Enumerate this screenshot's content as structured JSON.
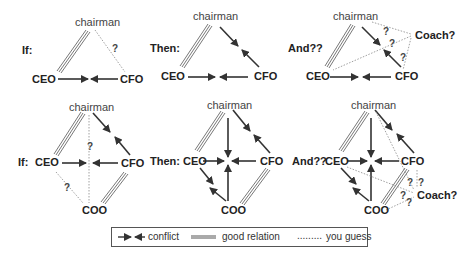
{
  "panels": [
    {
      "prefix": "If:",
      "nodes": {
        "chairman": "chairman",
        "ceo": "CEO",
        "cfo": "CFO"
      },
      "questions": [
        "?"
      ]
    },
    {
      "prefix": "Then:",
      "nodes": {
        "chairman": "chairman",
        "ceo": "CEO",
        "cfo": "CFO"
      }
    },
    {
      "prefix": "And??",
      "nodes": {
        "chairman": "chairman",
        "ceo": "CEO",
        "cfo": "CFO",
        "coach": "Coach?"
      },
      "questions": [
        "?",
        "?",
        "?"
      ]
    },
    {
      "prefix": "If:",
      "nodes": {
        "chairman": "chairman",
        "ceo": "CEO",
        "cfo": "CFO",
        "coo": "COO"
      },
      "questions": [
        "?",
        "?"
      ]
    },
    {
      "prefix": "Then:",
      "nodes": {
        "chairman": "chairman",
        "ceo": "CEO",
        "cfo": "CFO",
        "coo": "COO"
      }
    },
    {
      "prefix": "And??",
      "nodes": {
        "chairman": "chairman",
        "ceo": "CEO",
        "cfo": "CFO",
        "coo": "COO",
        "coach": "Coach?"
      },
      "questions": [
        "?",
        "?",
        "?",
        "?"
      ]
    }
  ],
  "legend": {
    "conflict": "conflict",
    "good_relation": "good relation",
    "you_guess": "you guess",
    "you_guess_dots": "........."
  },
  "colors": {
    "arrow": "#333333",
    "double_line": "#777777",
    "dotted": "#888888",
    "text": "#222222"
  }
}
